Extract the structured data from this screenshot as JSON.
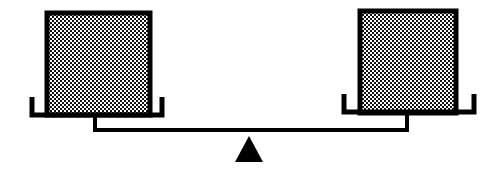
{
  "figure": {
    "type": "balance-scale-diagram",
    "state": "balanced",
    "background_color": "#ffffff",
    "ink_color": "#000000",
    "fill_color": "#ffffff",
    "stroke_width_px": 4
  },
  "beam": {
    "label": "beam",
    "x1": 93,
    "x2": 409,
    "y": 130,
    "thickness": 4,
    "tilt_degrees": 0
  },
  "fulcrum": {
    "label": "fulcrum",
    "shape": "triangle",
    "apex_x": 249,
    "apex_y": 136,
    "base_left_x": 235,
    "base_right_x": 263,
    "base_y": 162,
    "fill": "#000000"
  },
  "pans": [
    {
      "id": "left-pan",
      "label": "left pan",
      "side": "left",
      "bracket_left_x": 30,
      "bracket_right_x": 164,
      "bracket_top_y": 97,
      "bracket_bottom_y": 117,
      "hanger_x": 95,
      "hanger_top_y": 117,
      "hanger_bottom_y": 130
    },
    {
      "id": "right-pan",
      "label": "right pan",
      "side": "right",
      "bracket_left_x": 342,
      "bracket_right_x": 476,
      "bracket_top_y": 94,
      "bracket_bottom_y": 114,
      "hanger_x": 407,
      "hanger_top_y": 114,
      "hanger_bottom_y": 130
    }
  ],
  "blocks": [
    {
      "id": "left-block",
      "label": "left block",
      "side": "left",
      "x": 47,
      "y": 13,
      "width": 103,
      "height": 102,
      "fill_pattern": "checkerboard-dots",
      "pattern_pitch_px": 4,
      "border_width_px": 5,
      "border_color": "#000000"
    },
    {
      "id": "right-block",
      "label": "right block",
      "side": "right",
      "x": 360,
      "y": 11,
      "width": 96,
      "height": 102,
      "fill_pattern": "checkerboard-dots",
      "pattern_pitch_px": 4,
      "border_width_px": 5,
      "border_color": "#000000"
    }
  ],
  "accessibility": {
    "description": "A level balance scale. A horizontal beam rests on a solid black triangular fulcrum at its midpoint. At each end of the beam a short vertical hanger rises to a U-shaped pan bracket, and each bracket holds a square block filled with a dense black-and-white checkered dot pattern. The beam is horizontal, indicating the two blocks are of equal weight."
  }
}
